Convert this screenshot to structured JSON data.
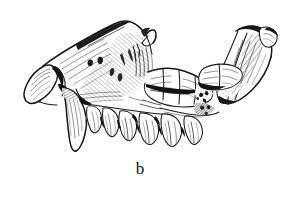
{
  "figure": {
    "caption": "b",
    "kind": "scientific-line-drawing",
    "technique": "pen-and-ink stipple and hatch",
    "background_color": "#ffffff",
    "ink_color": "#1a1a1a",
    "canvas": {
      "width": 292,
      "height": 222
    },
    "parts": [
      {
        "name": "premaxilla-incisor-region",
        "label": ""
      },
      {
        "name": "canine",
        "label": ""
      },
      {
        "name": "maxilla-cheek-tooth-row",
        "label": ""
      },
      {
        "name": "zygomatic-arch",
        "label": ""
      },
      {
        "name": "orbit-region",
        "label": ""
      },
      {
        "name": "mandible-ramus",
        "label": ""
      },
      {
        "name": "occipital-condyle-region",
        "label": ""
      }
    ]
  }
}
